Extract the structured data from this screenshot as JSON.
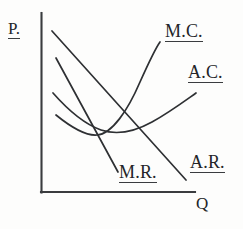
{
  "figure": {
    "kind": "economics-cost-revenue-diagram",
    "background_color": "#fdfdfc",
    "ink_color": "#2e3033"
  },
  "axes": {
    "y_label": "P.",
    "x_label": "Q",
    "y_label_underlined": true,
    "x_label_underlined": false,
    "origin": {
      "x": 41,
      "y": 192
    },
    "y_top": {
      "x": 41,
      "y": 13
    },
    "x_right": {
      "x": 195,
      "y": 192
    }
  },
  "curves": [
    {
      "name": "M.C.",
      "label": "M.C.",
      "label_underlined": true,
      "shape": "u-shaped-marginal-cost",
      "path": "M 56,115 C 72,128 86,136 97,135 C 112,134 128,110 140,82 C 149,62 155,49 160,42"
    },
    {
      "name": "A.C.",
      "label": "A.C.",
      "label_underlined": true,
      "shape": "u-shaped-average-cost",
      "path": "M 53,93 C 68,110 84,124 101,130 C 116,135 134,132 152,122 C 170,112 186,100 196,93"
    },
    {
      "name": "A.R.",
      "label": "A.R.",
      "label_underlined": true,
      "shape": "downward-sloping-demand-line",
      "path": "M 52,31 L 186,180"
    },
    {
      "name": "M.R.",
      "label": "M.R.",
      "label_underlined": true,
      "shape": "steeper-downward-sloping-marginal-revenue-line",
      "path": "M 56,58 L 118,172"
    }
  ],
  "labels": {
    "y_axis": "P.",
    "x_axis": "Q",
    "marginal_cost": "M.C.",
    "average_cost": "A.C.",
    "average_revenue": "A.R.",
    "marginal_revenue": "M.R."
  }
}
